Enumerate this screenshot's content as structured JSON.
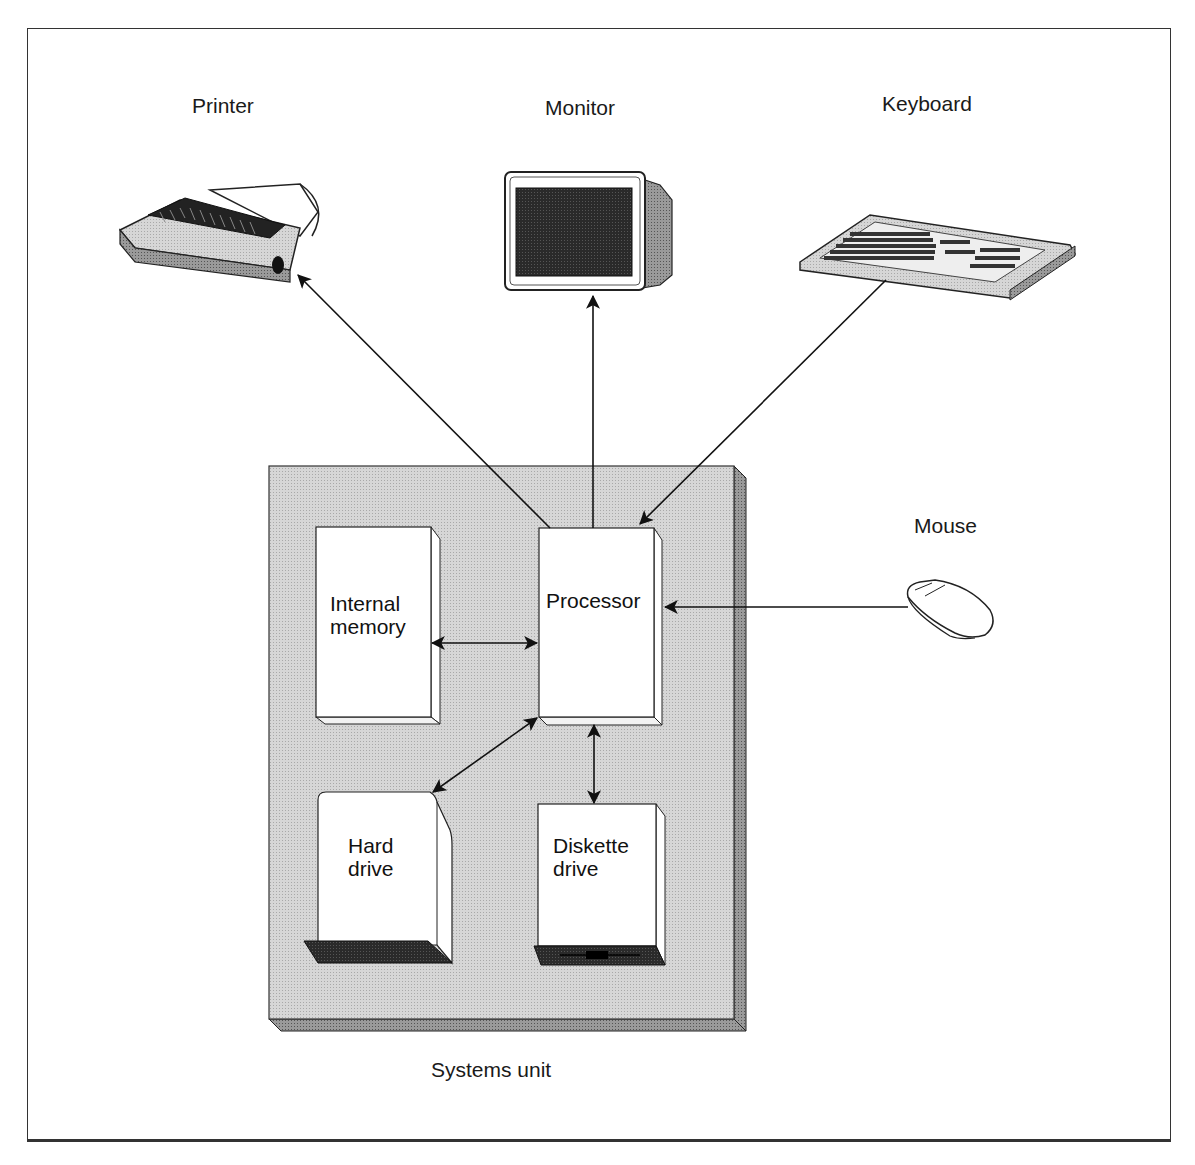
{
  "devices": {
    "printer": {
      "label": "Printer",
      "icon": "printer-icon"
    },
    "monitor": {
      "label": "Monitor",
      "icon": "monitor-icon"
    },
    "keyboard": {
      "label": "Keyboard",
      "icon": "keyboard-icon"
    },
    "mouse": {
      "label": "Mouse",
      "icon": "mouse-icon"
    }
  },
  "systems_unit": {
    "label": "Systems unit",
    "components": {
      "internal_memory": {
        "line1": "Internal",
        "line2": "memory"
      },
      "processor": {
        "line1": "Processor"
      },
      "hard_drive": {
        "line1": "Hard",
        "line2": "drive"
      },
      "diskette_drive": {
        "line1": "Diskette",
        "line2": "drive"
      }
    }
  },
  "connections": [
    {
      "from": "Processor",
      "to": "Printer",
      "direction": "to"
    },
    {
      "from": "Processor",
      "to": "Monitor",
      "direction": "to"
    },
    {
      "from": "Keyboard",
      "to": "Processor",
      "direction": "to"
    },
    {
      "from": "Mouse",
      "to": "Processor",
      "direction": "to"
    },
    {
      "from": "Internal memory",
      "to": "Processor",
      "direction": "both"
    },
    {
      "from": "Processor",
      "to": "Hard drive",
      "direction": "both"
    },
    {
      "from": "Processor",
      "to": "Diskette drive",
      "direction": "both"
    }
  ],
  "colors": {
    "unit_fill": "#d2d2d2",
    "unit_side": "#9a9a9a",
    "component_fill": "#ffffff",
    "stroke": "#1a1a1a"
  }
}
